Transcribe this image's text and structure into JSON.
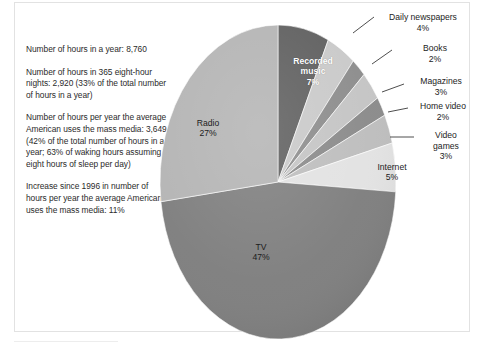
{
  "figure": {
    "caption": "",
    "background_color": "#ffffff",
    "frame_color": "#e2e2e2"
  },
  "side_notes": [
    "Number of hours in a year: 8,760",
    "Number of hours in 365 eight-hour nights: 2,920 (33% of the total number of hours in a year)",
    "Number of hours per year the average American uses the mass media: 3,649 (42% of the total number of hours in a year; 63% of waking hours assuming eight hours of sleep per day)",
    "Increase since 1996 in number of hours per year the average American uses the mass media: 11%"
  ],
  "chart_data": {
    "type": "pie",
    "title": "",
    "total_label": "100%",
    "legend_position": "callouts",
    "categories": [
      "Recorded music",
      "Daily newspapers",
      "Books",
      "Magazines",
      "Home video",
      "Video games",
      "Internet",
      "TV",
      "Radio"
    ],
    "values": [
      7,
      4,
      2,
      3,
      2,
      3,
      5,
      47,
      27
    ],
    "value_labels": [
      "7%",
      "4%",
      "2%",
      "3%",
      "2%",
      "3%",
      "5%",
      "47%",
      "27%"
    ],
    "colors": [
      "#5f5f5f",
      "#c9c9c9",
      "#8c8c8c",
      "#c4c4c4",
      "#8a8a8a",
      "#bdbdbd",
      "#e2e2e2",
      "#7e7e7e",
      "#b4b4b4"
    ],
    "slices": [
      {
        "name": "Recorded music",
        "pct": 7,
        "label": "Recorded music",
        "pct_label": "7%",
        "label_style": "inside-white"
      },
      {
        "name": "Daily newspapers",
        "pct": 4,
        "label": "Daily  newspapers",
        "pct_label": "4%",
        "label_style": "callout"
      },
      {
        "name": "Books",
        "pct": 2,
        "label": "Books",
        "pct_label": "2%",
        "label_style": "callout"
      },
      {
        "name": "Magazines",
        "pct": 3,
        "label": "Magazines",
        "pct_label": "3%",
        "label_style": "callout"
      },
      {
        "name": "Home video",
        "pct": 2,
        "label": "Home video",
        "pct_label": "2%",
        "label_style": "callout"
      },
      {
        "name": "Video games",
        "pct": 3,
        "label": "Video games",
        "pct_label": "3%",
        "label_style": "callout"
      },
      {
        "name": "Internet",
        "pct": 5,
        "label": "Internet",
        "pct_label": "5%",
        "label_style": "inside-dark"
      },
      {
        "name": "TV",
        "pct": 47,
        "label": "TV",
        "pct_label": "47%",
        "label_style": "inside-dark"
      },
      {
        "name": "Radio",
        "pct": 27,
        "label": "Radio",
        "pct_label": "27%",
        "label_style": "inside-dark"
      }
    ]
  },
  "labels": {
    "recorded_music": "Recorded",
    "recorded_music2": "music",
    "recorded_music_pct": "7%",
    "radio": "Radio",
    "radio_pct": "27%",
    "tv": "TV",
    "tv_pct": "47%",
    "internet": "Internet",
    "internet_pct": "5%",
    "newspapers": "Daily  newspapers",
    "newspapers_pct": "4%",
    "books": "Books",
    "books_pct": "2%",
    "magazines": "Magazines",
    "magazines_pct": "3%",
    "home_video": "Home video",
    "home_video_pct": "2%",
    "video_games": "Video",
    "video_games2": "games",
    "video_games_pct": "3%"
  }
}
